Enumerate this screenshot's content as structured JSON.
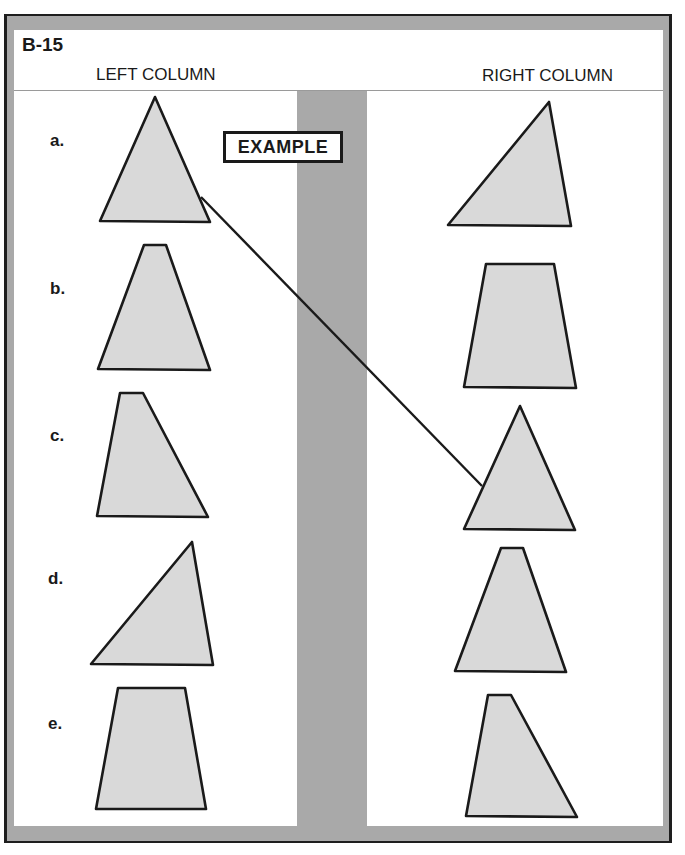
{
  "worksheet": {
    "code": "B-15",
    "left_column_title": "LEFT COLUMN",
    "right_column_title": "RIGHT COLUMN",
    "example_label": "EXAMPLE",
    "colors": {
      "frame": "#a9a9a9",
      "border": "#1e1e1e",
      "shape_fill": "#d9d9d9",
      "shape_stroke": "#1a1a1a",
      "panel": "#ffffff"
    }
  },
  "left_items": [
    {
      "label": "a.",
      "shape": "isosceles-triangle",
      "points": "155,97 210,222 100,221"
    },
    {
      "label": "b.",
      "shape": "narrow-trapezoid",
      "points": "144,245 166,245 210,370 98,369"
    },
    {
      "label": "c.",
      "shape": "right-leaning-trapezoid",
      "points": "120,393 143,393 208,517 97,516"
    },
    {
      "label": "d.",
      "shape": "scalene-triangle",
      "points": "192,542 213,665 91,664"
    },
    {
      "label": "e.",
      "shape": "wide-trapezoid",
      "points": "118,688 185,688 206,809 96,809"
    }
  ],
  "right_items": [
    {
      "shape": "scalene-triangle",
      "points": "549,102 571,226 448,225"
    },
    {
      "shape": "wide-trapezoid",
      "points": "486,264 554,264 576,388 464,387"
    },
    {
      "shape": "isosceles-triangle",
      "points": "520,406 575,530 464,529"
    },
    {
      "shape": "narrow-trapezoid",
      "points": "501,548 523,548 566,672 455,671"
    },
    {
      "shape": "right-leaning-trapezoid",
      "points": "488,695 511,695 577,817 466,816"
    }
  ],
  "example_connection": {
    "from": "left a.",
    "to": "right item 3",
    "x1": 201,
    "y1": 197,
    "x2": 482,
    "y2": 486
  }
}
